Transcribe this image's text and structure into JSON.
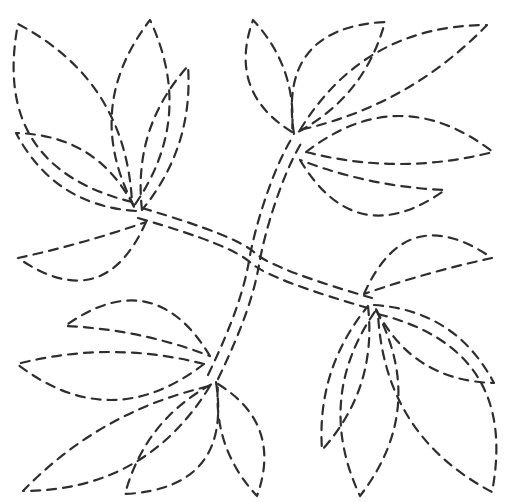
{
  "pattern": {
    "canvas": {
      "width": 510,
      "height": 502
    },
    "background": "#ffffff",
    "stroke": {
      "color": "#2e2e2e",
      "width": 2.2,
      "dash": "9 7",
      "linecap": "round"
    },
    "stems": [
      {
        "name": "stem-topleft-to-bottomright",
        "lines": [
          "M142,208 C206,227 242,241 255,253 C268,265 316,282 372,298",
          "M138,218 C204,237 238,251 251,263 C264,275 312,292 368,308"
        ]
      },
      {
        "name": "stem-bottomleft-to-topright",
        "lines": [
          "M208,375 C234,321 244,289 249,261 C254,230 272,170 292,138",
          "M218,379 C244,325 254,293 259,265 C264,234 282,174 302,142"
        ]
      }
    ],
    "leaves": [
      {
        "id": "top-left-1",
        "base": [
          132,
          202
        ],
        "tip": [
          18,
          24
        ],
        "bulge1": 50,
        "bulge2": -30
      },
      {
        "id": "top-left-2",
        "base": [
          134,
          206
        ],
        "tip": [
          150,
          20
        ],
        "bulge1": 30,
        "bulge2": -27
      },
      {
        "id": "top-left-3",
        "base": [
          142,
          210
        ],
        "tip": [
          188,
          66
        ],
        "bulge1": 17,
        "bulge2": -15
      },
      {
        "id": "top-left-4",
        "base": [
          136,
          211
        ],
        "tip": [
          16,
          133
        ],
        "bulge1": 20,
        "bulge2": -22
      },
      {
        "id": "top-left-5",
        "base": [
          146,
          222
        ],
        "tip": [
          18,
          258
        ],
        "bulge1": 40,
        "bulge2": 2
      },
      {
        "id": "top-right-1",
        "base": [
          292,
          132
        ],
        "tip": [
          253,
          20
        ],
        "bulge1": 24,
        "bulge2": -13
      },
      {
        "id": "top-right-2",
        "base": [
          294,
          134
        ],
        "tip": [
          385,
          22
        ],
        "bulge1": 40,
        "bulge2": -16
      },
      {
        "id": "top-right-3",
        "base": [
          300,
          130
        ],
        "tip": [
          487,
          25
        ],
        "bulge1": 30,
        "bulge2": -16
      },
      {
        "id": "top-right-4",
        "base": [
          306,
          152
        ],
        "tip": [
          493,
          152
        ],
        "bulge1": 36,
        "bulge2": -12
      },
      {
        "id": "top-right-5",
        "base": [
          300,
          160
        ],
        "tip": [
          445,
          190
        ],
        "bulge1": -40,
        "bulge2": -6
      },
      {
        "id": "bottom-left-1",
        "base": [
          218,
          384
        ],
        "tip": [
          257,
          496
        ],
        "bulge1": 24,
        "bulge2": -13
      },
      {
        "id": "bottom-left-2",
        "base": [
          216,
          382
        ],
        "tip": [
          125,
          494
        ],
        "bulge1": 40,
        "bulge2": -16
      },
      {
        "id": "bottom-left-3",
        "base": [
          210,
          386
        ],
        "tip": [
          23,
          491
        ],
        "bulge1": 30,
        "bulge2": -16
      },
      {
        "id": "bottom-left-4",
        "base": [
          204,
          364
        ],
        "tip": [
          17,
          364
        ],
        "bulge1": 36,
        "bulge2": -12
      },
      {
        "id": "bottom-left-5",
        "base": [
          210,
          356
        ],
        "tip": [
          65,
          326
        ],
        "bulge1": -40,
        "bulge2": -6
      },
      {
        "id": "bottom-right-1",
        "base": [
          378,
          314
        ],
        "tip": [
          492,
          492
        ],
        "bulge1": 50,
        "bulge2": -30
      },
      {
        "id": "bottom-right-2",
        "base": [
          376,
          310
        ],
        "tip": [
          360,
          496
        ],
        "bulge1": 30,
        "bulge2": -27
      },
      {
        "id": "bottom-right-3",
        "base": [
          368,
          306
        ],
        "tip": [
          322,
          450
        ],
        "bulge1": 17,
        "bulge2": -15
      },
      {
        "id": "bottom-right-4",
        "base": [
          374,
          305
        ],
        "tip": [
          494,
          383
        ],
        "bulge1": 20,
        "bulge2": -22
      },
      {
        "id": "bottom-right-5",
        "base": [
          364,
          294
        ],
        "tip": [
          492,
          258
        ],
        "bulge1": 40,
        "bulge2": 2
      }
    ]
  }
}
